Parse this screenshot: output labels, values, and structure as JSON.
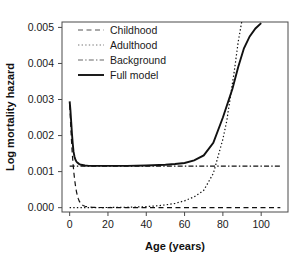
{
  "chart_data": {
    "type": "line",
    "title": "",
    "xlabel": "Age (years)",
    "ylabel": "Log mortality hazard",
    "xlim": [
      -4,
      114
    ],
    "ylim": [
      -0.00012,
      0.00515
    ],
    "xticks": [
      0,
      20,
      40,
      60,
      80,
      100
    ],
    "xtick_labels": [
      "0",
      "20",
      "40",
      "60",
      "80",
      "100"
    ],
    "yticks": [
      0.0,
      0.001,
      0.002,
      0.003,
      0.004,
      0.005
    ],
    "ytick_labels": [
      "0.000",
      "0.001",
      "0.002",
      "0.003",
      "0.004",
      "0.005"
    ],
    "grid": false,
    "legend_position": "top-left",
    "legend": [
      {
        "label": "Childhood",
        "style": "dashed",
        "color": "#555555"
      },
      {
        "label": "Adulthood",
        "style": "dotted",
        "color": "#777777"
      },
      {
        "label": "Background",
        "style": "dashdot",
        "color": "#666666"
      },
      {
        "label": "Full model",
        "style": "solid",
        "color": "#111111"
      }
    ],
    "series": [
      {
        "name": "Childhood",
        "style": "dashed",
        "color": "#555555",
        "x": [
          0,
          0.3,
          0.6,
          1,
          1.4,
          1.8,
          2.2,
          2.6,
          3,
          3.5,
          4,
          4.5,
          5,
          6,
          7,
          8,
          10,
          12,
          15,
          20,
          30,
          40,
          50,
          60,
          70,
          80,
          90,
          100,
          110
        ],
        "y": [
          0.00285,
          0.00255,
          0.00222,
          0.00182,
          0.00148,
          0.0012,
          0.00097,
          0.00078,
          0.00062,
          0.00046,
          0.00034,
          0.00025,
          0.00018,
          0.0001,
          6e-05,
          4e-05,
          2e-05,
          1e-05,
          5e-06,
          2e-06,
          1e-06,
          1e-06,
          1e-06,
          1e-06,
          1e-06,
          1e-06,
          1e-06,
          1e-06,
          1e-06
        ]
      },
      {
        "name": "Adulthood",
        "style": "dotted",
        "color": "#777777",
        "x": [
          0,
          5,
          10,
          15,
          20,
          25,
          30,
          35,
          40,
          45,
          50,
          55,
          60,
          65,
          70,
          75,
          80,
          82,
          84,
          86,
          88,
          90
        ],
        "y": [
          8e-07,
          1.2e-06,
          1.9e-06,
          3e-06,
          4.8e-06,
          7.6e-06,
          1.2e-05,
          1.9e-05,
          3e-05,
          4.8e-05,
          7.6e-05,
          0.00012,
          0.00019,
          0.0003,
          0.00048,
          0.00095,
          0.0019,
          0.0024,
          0.0031,
          0.0038,
          0.0046,
          0.0052
        ]
      },
      {
        "name": "Background",
        "style": "dashdot",
        "color": "#666666",
        "x": [
          0,
          110
        ],
        "y": [
          0.00115,
          0.00115
        ]
      },
      {
        "name": "Full model",
        "style": "solid",
        "color": "#111111",
        "x": [
          0,
          0.4,
          0.8,
          1.2,
          1.6,
          2,
          2.5,
          3,
          3.5,
          4,
          5,
          6,
          8,
          10,
          15,
          20,
          30,
          40,
          50,
          55,
          60,
          65,
          70,
          75,
          80,
          85,
          88,
          91,
          94,
          97,
          100
        ],
        "y": [
          0.00295,
          0.0027,
          0.00238,
          0.00205,
          0.00178,
          0.00156,
          0.00142,
          0.00133,
          0.00128,
          0.00125,
          0.00121,
          0.00119,
          0.00117,
          0.00116,
          0.00116,
          0.00116,
          0.00116,
          0.00117,
          0.00119,
          0.00121,
          0.00124,
          0.00131,
          0.00145,
          0.0018,
          0.0025,
          0.0033,
          0.0039,
          0.00442,
          0.00475,
          0.00497,
          0.00512
        ]
      }
    ]
  }
}
